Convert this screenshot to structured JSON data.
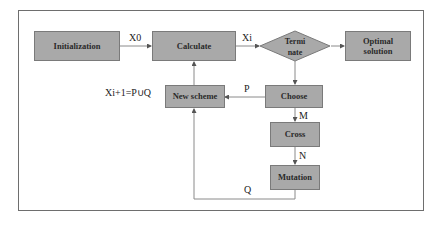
{
  "diagram": {
    "nodes": {
      "initialization": "Initialization",
      "calculate": "Calculate",
      "terminate_line1": "Termi",
      "terminate_line2": "nate",
      "optimal_line1": "Optimal",
      "optimal_line2": "solution",
      "new_scheme": "New scheme",
      "choose": "Choose",
      "cross": "Cross",
      "mutation": "Mutation"
    },
    "edge_labels": {
      "x0": "X0",
      "xi": "Xi",
      "p": "P",
      "m": "M",
      "n": "N",
      "q": "Q",
      "xi_plus_1": "Xi+1=P∪Q"
    },
    "colors": {
      "node_fill": "#a9a9a9",
      "node_border": "#7a7a7a",
      "line": "#8a8a8a",
      "frame": "#6e6e6e"
    }
  }
}
